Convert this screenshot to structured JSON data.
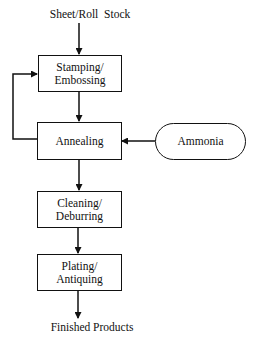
{
  "diagram": {
    "type": "process-flowchart",
    "input_label": "Sheet/Roll  Stock",
    "output_label": "Finished Products",
    "nodes": [
      {
        "id": "stamping",
        "line1": "Stamping/",
        "line2": "Embossing",
        "shape": "rectangle"
      },
      {
        "id": "annealing",
        "line1": "Annealing",
        "line2": "",
        "shape": "rectangle"
      },
      {
        "id": "cleaning",
        "line1": "Cleaning/",
        "line2": "Deburring",
        "shape": "rectangle"
      },
      {
        "id": "plating",
        "line1": "Plating/",
        "line2": "Antiquing",
        "shape": "rectangle"
      },
      {
        "id": "ammonia",
        "line1": "Ammonia",
        "line2": "",
        "shape": "rounded-terminal"
      }
    ],
    "edges": [
      {
        "from": "input",
        "to": "stamping"
      },
      {
        "from": "stamping",
        "to": "annealing"
      },
      {
        "from": "annealing",
        "to": "stamping",
        "style": "feedback-loop-left"
      },
      {
        "from": "ammonia",
        "to": "annealing"
      },
      {
        "from": "annealing",
        "to": "cleaning"
      },
      {
        "from": "cleaning",
        "to": "plating"
      },
      {
        "from": "plating",
        "to": "output"
      }
    ],
    "colors": {
      "stroke": "#111111",
      "background": "#ffffff"
    }
  }
}
